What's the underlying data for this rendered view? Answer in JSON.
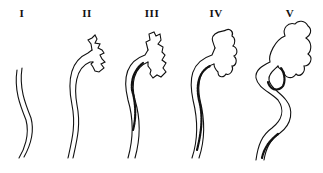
{
  "diagram": {
    "type": "stage-sequence illustration",
    "stages": [
      {
        "label": "I",
        "x": 22
      },
      {
        "label": "II",
        "x": 87
      },
      {
        "label": "III",
        "x": 152
      },
      {
        "label": "IV",
        "x": 216
      },
      {
        "label": "V",
        "x": 290
      }
    ],
    "colors": {
      "ink": "#111111",
      "background": "#ffffff"
    }
  }
}
